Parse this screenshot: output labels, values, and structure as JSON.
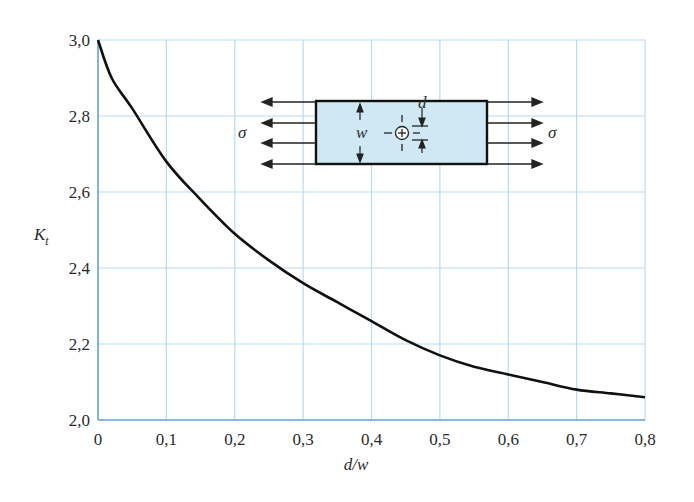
{
  "chart_data": {
    "type": "line",
    "title": "",
    "xlabel": "d/w",
    "ylabel": "K_t",
    "ylabel_main": "K",
    "ylabel_sub": "t",
    "xlim": [
      0,
      0.8
    ],
    "ylim": [
      2.0,
      3.0
    ],
    "grid": true,
    "x_ticks": [
      "0",
      "0,1",
      "0,2",
      "0,3",
      "0,4",
      "0,5",
      "0,6",
      "0,7",
      "0,8"
    ],
    "y_ticks": [
      "2,0",
      "2,2",
      "2,4",
      "2,6",
      "2,8",
      "3,0"
    ],
    "series": [
      {
        "name": "K_t vs d/w",
        "x": [
          0.0,
          0.02,
          0.05,
          0.1,
          0.15,
          0.2,
          0.25,
          0.3,
          0.35,
          0.4,
          0.45,
          0.5,
          0.55,
          0.6,
          0.65,
          0.7,
          0.75,
          0.8
        ],
        "values": [
          3.0,
          2.9,
          2.82,
          2.68,
          2.58,
          2.49,
          2.42,
          2.36,
          2.31,
          2.26,
          2.21,
          2.17,
          2.14,
          2.12,
          2.1,
          2.08,
          2.07,
          2.06
        ]
      }
    ],
    "annotations": {
      "inset_diagram": "Plate of width w with central hole of diameter d under uniaxial tension σ",
      "labels": [
        "σ",
        "σ",
        "w",
        "d"
      ]
    }
  },
  "inset": {
    "sigma_left": "σ",
    "sigma_right": "σ",
    "width_label": "w",
    "hole_label": "d",
    "plate_color": "#cfe8f3"
  },
  "colors": {
    "grid": "#b7dcee",
    "axis": "#6fa3dc",
    "curve": "#111111"
  }
}
